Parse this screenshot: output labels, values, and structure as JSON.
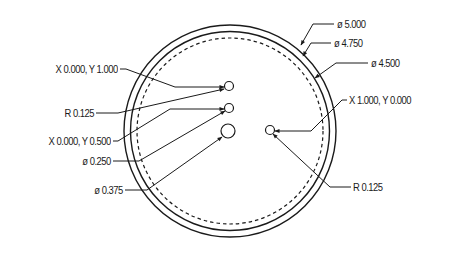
{
  "drawing": {
    "circles": {
      "outer": {
        "label": "ø 5.000",
        "cx": 230,
        "cy": 131,
        "r": 106
      },
      "middle": {
        "label": "ø 4.750",
        "cx": 230,
        "cy": 131,
        "r": 99
      },
      "bolt_circle": {
        "label": "ø 4.500",
        "cx": 230,
        "cy": 131,
        "r": 93,
        "style": "dashed"
      }
    },
    "holes": [
      {
        "id": "hole-top",
        "cx": 229,
        "cy": 86,
        "r": 4.5,
        "position_label": "X 0.000, Y 1.000",
        "size_label": "R 0.125"
      },
      {
        "id": "hole-mid",
        "cx": 229,
        "cy": 108,
        "r": 4.5,
        "position_label": "X 0.000, Y 0.500",
        "size_label": "ø 0.250"
      },
      {
        "id": "hole-center",
        "cx": 228,
        "cy": 131,
        "r": 7,
        "size_label": "ø 0.375"
      },
      {
        "id": "hole-right",
        "cx": 270,
        "cy": 130,
        "r": 4.5,
        "position_label": "X 1.000, Y 0.000",
        "size_label": "R 0.125"
      }
    ],
    "labels": {
      "dia_5000": "ø 5.000",
      "dia_4750": "ø 4.750",
      "dia_4500": "ø 4.500",
      "xy_top": "X 0.000, Y 1.000",
      "r_top": "R 0.125",
      "xy_mid": "X 0.000, Y 0.500",
      "dia_0250": "ø 0.250",
      "dia_0375": "ø 0.375",
      "xy_right": "X 1.000, Y 0.000",
      "r_right": "R 0.125"
    },
    "colors": {
      "line": "#1a1a1a",
      "background": "#ffffff"
    }
  }
}
